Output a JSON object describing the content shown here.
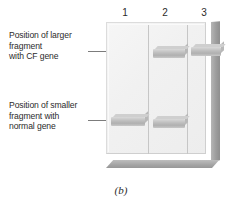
{
  "figure": {
    "caption": "(b)",
    "type": "gel-electrophoresis-diagram"
  },
  "labels": {
    "upper": "Position of larger\nfragment\nwith CF gene",
    "lower": "Position of smaller\nfragment with\nnormal gene"
  },
  "gel": {
    "lane_numbers": [
      "1",
      "2",
      "3"
    ],
    "colors": {
      "gel_face": "#f1f1f1",
      "gel_side": "#9d9d9d",
      "band": "#b0b0b0",
      "divider": "#c6c6c6",
      "leader_line": "#7c7c7c",
      "text": "#2b2b2b"
    }
  },
  "chart_data": {
    "type": "table",
    "categories": [
      "1",
      "2",
      "3"
    ],
    "xlabel": "Lane",
    "ylabel": "Fragment position",
    "series": [
      {
        "name": "Larger fragment with CF gene",
        "values": [
          0,
          1,
          1
        ]
      },
      {
        "name": "Smaller fragment with normal gene",
        "values": [
          1,
          1,
          0
        ]
      }
    ],
    "annotations": [
      "Position of larger fragment with CF gene",
      "Position of smaller fragment with normal gene"
    ],
    "legend": "position"
  }
}
